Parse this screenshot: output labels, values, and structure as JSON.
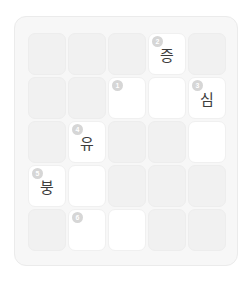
{
  "puzzle": {
    "title": "Korean Crossword Grid",
    "rows": 5,
    "cols": 5,
    "colors": {
      "page_background": "#ffffff",
      "card_background": "#f7f7f7",
      "card_border": "#ebebeb",
      "blocked_cell": "#f1f1f1",
      "open_cell": "#ffffff",
      "cell_border": "#f0f0f0",
      "letter_text": "#3d3d3d",
      "number_badge": "#d6d6d6",
      "number_text": "#ffffff"
    },
    "cells": [
      {
        "row": 1,
        "col": 1,
        "state": "blocked",
        "number": "",
        "letter": ""
      },
      {
        "row": 1,
        "col": 2,
        "state": "blocked",
        "number": "",
        "letter": ""
      },
      {
        "row": 1,
        "col": 3,
        "state": "blocked",
        "number": "",
        "letter": ""
      },
      {
        "row": 1,
        "col": 4,
        "state": "open",
        "number": "2",
        "letter": "증"
      },
      {
        "row": 1,
        "col": 5,
        "state": "blocked",
        "number": "",
        "letter": ""
      },
      {
        "row": 2,
        "col": 1,
        "state": "blocked",
        "number": "",
        "letter": ""
      },
      {
        "row": 2,
        "col": 2,
        "state": "blocked",
        "number": "",
        "letter": ""
      },
      {
        "row": 2,
        "col": 3,
        "state": "open",
        "number": "1",
        "letter": ""
      },
      {
        "row": 2,
        "col": 4,
        "state": "open",
        "number": "",
        "letter": ""
      },
      {
        "row": 2,
        "col": 5,
        "state": "open",
        "number": "3",
        "letter": "심"
      },
      {
        "row": 3,
        "col": 1,
        "state": "blocked",
        "number": "",
        "letter": ""
      },
      {
        "row": 3,
        "col": 2,
        "state": "open",
        "number": "4",
        "letter": "유"
      },
      {
        "row": 3,
        "col": 3,
        "state": "blocked",
        "number": "",
        "letter": ""
      },
      {
        "row": 3,
        "col": 4,
        "state": "blocked",
        "number": "",
        "letter": ""
      },
      {
        "row": 3,
        "col": 5,
        "state": "open",
        "number": "",
        "letter": ""
      },
      {
        "row": 4,
        "col": 1,
        "state": "open",
        "number": "5",
        "letter": "붕"
      },
      {
        "row": 4,
        "col": 2,
        "state": "open",
        "number": "",
        "letter": ""
      },
      {
        "row": 4,
        "col": 3,
        "state": "blocked",
        "number": "",
        "letter": ""
      },
      {
        "row": 4,
        "col": 4,
        "state": "blocked",
        "number": "",
        "letter": ""
      },
      {
        "row": 4,
        "col": 5,
        "state": "blocked",
        "number": "",
        "letter": ""
      },
      {
        "row": 5,
        "col": 1,
        "state": "blocked",
        "number": "",
        "letter": ""
      },
      {
        "row": 5,
        "col": 2,
        "state": "open",
        "number": "6",
        "letter": ""
      },
      {
        "row": 5,
        "col": 3,
        "state": "open",
        "number": "",
        "letter": ""
      },
      {
        "row": 5,
        "col": 4,
        "state": "blocked",
        "number": "",
        "letter": ""
      },
      {
        "row": 5,
        "col": 5,
        "state": "blocked",
        "number": "",
        "letter": ""
      }
    ]
  }
}
